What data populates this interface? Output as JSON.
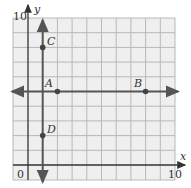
{
  "figure": {
    "type": "coordinate-grid",
    "x_axis_label": "x",
    "y_axis_label": "y",
    "origin_label": "0",
    "x_max_label": "10",
    "y_max_label": "10",
    "x_range": [
      -1,
      10
    ],
    "y_range": [
      -1,
      10
    ],
    "grid": true,
    "lines": [
      {
        "name": "horizontal-line",
        "equation": "y = 5"
      },
      {
        "name": "vertical-line",
        "equation": "x = 1"
      }
    ],
    "points": [
      {
        "label": "A",
        "x": 2,
        "y": 5
      },
      {
        "label": "B",
        "x": 8,
        "y": 5
      },
      {
        "label": "C",
        "x": 1,
        "y": 8
      },
      {
        "label": "D",
        "x": 1,
        "y": 2
      }
    ],
    "colors": {
      "grid_bg": "#efefef",
      "grid_line": "#b0b0b0",
      "axis": "#333333",
      "line": "#555555"
    }
  }
}
